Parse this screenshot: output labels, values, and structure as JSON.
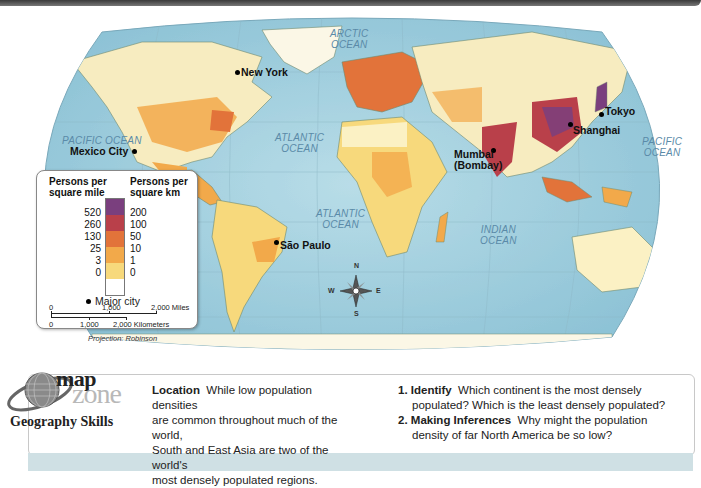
{
  "map": {
    "oceans": [
      {
        "id": "arctic",
        "text": "ARCTIC\nOCEAN",
        "lines": [
          "ARCTIC",
          "OCEAN"
        ]
      },
      {
        "id": "pacific-west",
        "lines": [
          "PACIFIC OCEAN"
        ]
      },
      {
        "id": "atlantic-north",
        "lines": [
          "ATLANTIC",
          "OCEAN"
        ]
      },
      {
        "id": "atlantic-south",
        "lines": [
          "ATLANTIC",
          "OCEAN"
        ]
      },
      {
        "id": "indian",
        "lines": [
          "INDIAN",
          "OCEAN"
        ]
      },
      {
        "id": "pacific-east",
        "lines": [
          "PACIFIC",
          "OCEAN"
        ]
      }
    ],
    "cities": [
      {
        "name": "New York"
      },
      {
        "name": "Mexico City"
      },
      {
        "name": "São Paulo"
      },
      {
        "name": "Mumbai\n(Bombay)",
        "line1": "Mumbai",
        "line2": "(Bombay)"
      },
      {
        "name": "Shanghai"
      },
      {
        "name": "Tokyo"
      }
    ],
    "compass": {
      "n": "N",
      "s": "S",
      "e": "E",
      "w": "W"
    }
  },
  "legend": {
    "header_mile_1": "Persons per",
    "header_mile_2": "square mile",
    "header_km_1": "Persons per",
    "header_km_2": "square km",
    "mile_values": [
      "520",
      "260",
      "130",
      "25",
      "3",
      "0"
    ],
    "km_values": [
      "200",
      "100",
      "50",
      "10",
      "1",
      "0"
    ],
    "colors": [
      "#7a3f7e",
      "#b9404a",
      "#e2733a",
      "#f2a94a",
      "#f7d97c",
      "#fbf1c4"
    ],
    "lowest_color": "#ffffff",
    "major_city_label": "Major city",
    "scale_miles": [
      "0",
      "1,000",
      "2,000 Miles"
    ],
    "scale_km": [
      "0",
      "1,000",
      "2,000 Kilometers"
    ],
    "projection": "Projection: Robinson"
  },
  "colors": {
    "ocean": "#a9d3e0",
    "land_base": "#f7ecc0",
    "ocean_text": "#5a8aa8",
    "panel_strip": "#cfe0e4"
  },
  "mapzone": {
    "logo_top": "map",
    "logo_bottom": "zone",
    "subtitle": "Geography Skills"
  },
  "skills": {
    "location_heading": "Location",
    "location_text": "While low population densities are common throughout much of the world, South and East Asia are two of the world's most densely populated regions.",
    "location_lines": [
      "While low population densities",
      "are common throughout much of the world,",
      "South and East Asia are two of the world's",
      "most densely populated regions."
    ],
    "questions": [
      {
        "num": "1.",
        "heading": "Identify",
        "line1": "Which continent is the most densely",
        "line2": "populated? Which is the least densely populated?"
      },
      {
        "num": "2.",
        "heading": "Making Inferences",
        "line1": "Why might the population",
        "line2": "density of far North America be so low?"
      }
    ]
  }
}
